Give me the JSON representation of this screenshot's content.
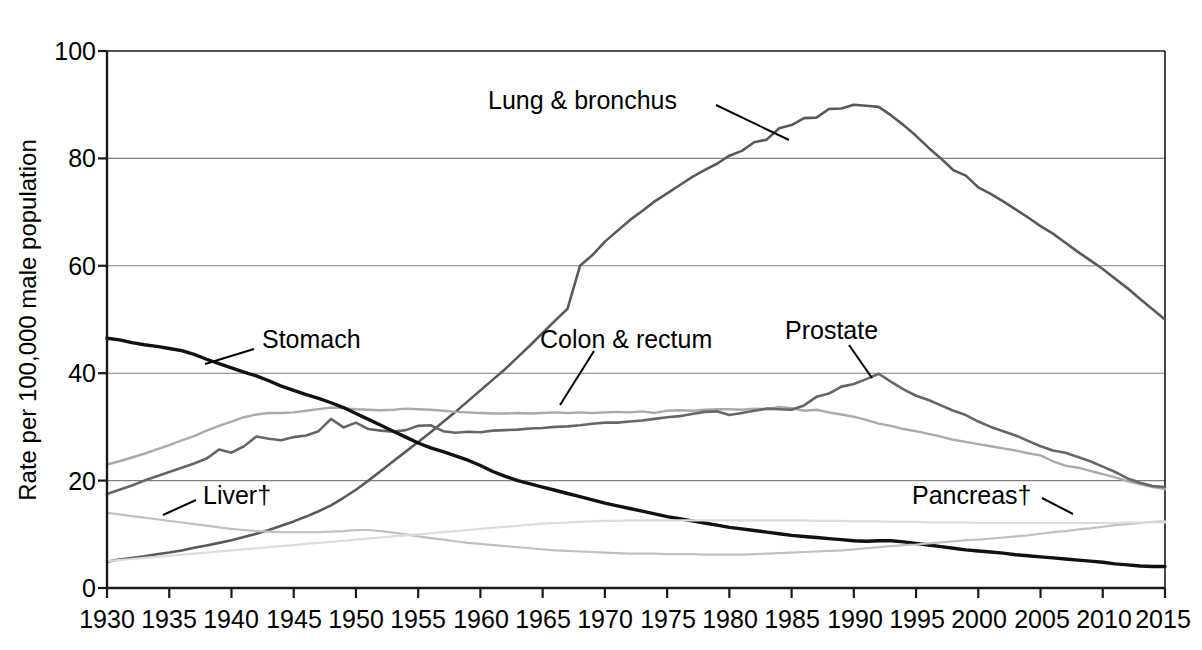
{
  "chart_data": {
    "type": "line",
    "title": "",
    "xlabel": "",
    "ylabel": "Rate per 100,000 male population",
    "xlim": [
      1930,
      2015
    ],
    "ylim": [
      0,
      100
    ],
    "yticks": [
      0,
      20,
      40,
      60,
      80,
      100
    ],
    "ytick_labels": [
      "0",
      "20",
      "40",
      "60",
      "80",
      "100"
    ],
    "xticks": [
      1930,
      1935,
      1940,
      1945,
      1950,
      1955,
      1960,
      1965,
      1970,
      1975,
      1980,
      1985,
      1990,
      1995,
      2000,
      2005,
      2010,
      2015
    ],
    "xtick_labels": [
      "1930",
      "1935",
      "1940",
      "1945",
      "1950",
      "1955",
      "1960",
      "1965",
      "1970",
      "1975",
      "1980",
      "1985",
      "1990",
      "1995",
      "2000",
      "2005",
      "2010",
      "2015"
    ],
    "grid": "horizontal",
    "legend": "inline-annotations",
    "x": [
      1930,
      1931,
      1932,
      1933,
      1934,
      1935,
      1936,
      1937,
      1938,
      1939,
      1940,
      1941,
      1942,
      1943,
      1944,
      1945,
      1946,
      1947,
      1948,
      1949,
      1950,
      1951,
      1952,
      1953,
      1954,
      1955,
      1956,
      1957,
      1958,
      1959,
      1960,
      1961,
      1962,
      1963,
      1964,
      1965,
      1966,
      1967,
      1968,
      1969,
      1970,
      1971,
      1972,
      1973,
      1974,
      1975,
      1976,
      1977,
      1978,
      1979,
      1980,
      1981,
      1982,
      1983,
      1984,
      1985,
      1986,
      1987,
      1988,
      1989,
      1990,
      1991,
      1992,
      1993,
      1994,
      1995,
      1996,
      1997,
      1998,
      1999,
      2000,
      2001,
      2002,
      2003,
      2004,
      2005,
      2006,
      2007,
      2008,
      2009,
      2010,
      2011,
      2012,
      2013,
      2014,
      2015
    ],
    "series": [
      {
        "name": "Lung & bronchus",
        "color": "#595959",
        "width": 2.6,
        "label_x": 1963,
        "label_y": 93,
        "values": [
          4.9,
          5.3,
          5.6,
          5.9,
          6.3,
          6.6,
          7.0,
          7.5,
          7.9,
          8.4,
          8.9,
          9.5,
          10.1,
          10.8,
          11.6,
          12.4,
          13.3,
          14.3,
          15.4,
          16.8,
          18.3,
          20.0,
          21.8,
          23.6,
          25.4,
          27.2,
          29.0,
          30.9,
          32.8,
          34.8,
          36.8,
          38.8,
          40.8,
          43.0,
          45.2,
          47.5,
          49.8,
          52.0,
          60.0,
          62.0,
          64.5,
          66.5,
          68.5,
          70.2,
          72.0,
          73.5,
          75.0,
          76.5,
          77.8,
          79.0,
          80.5,
          81.4,
          83.0,
          83.5,
          85.6,
          86.2,
          87.5,
          87.6,
          89.2,
          89.3,
          90.0,
          89.8,
          89.6,
          88.0,
          86.2,
          84.2,
          82.0,
          80.0,
          77.8,
          76.8,
          74.6,
          73.4,
          72.0,
          70.5,
          69.0,
          67.4,
          66.0,
          64.3,
          62.6,
          61.0,
          59.4,
          57.6,
          55.8,
          53.8,
          51.9,
          50.0
        ]
      },
      {
        "name": "Colon & rectum",
        "color": "#aaaaaa",
        "width": 2.4,
        "label_x": 1964,
        "label_y": 46,
        "values": [
          23.0,
          23.6,
          24.3,
          25.0,
          25.8,
          26.6,
          27.5,
          28.3,
          29.3,
          30.2,
          31.0,
          31.8,
          32.3,
          32.6,
          32.6,
          32.7,
          33.0,
          33.3,
          33.6,
          33.5,
          33.3,
          33.2,
          33.1,
          33.2,
          33.4,
          33.3,
          33.2,
          33.0,
          32.8,
          32.7,
          32.6,
          32.5,
          32.5,
          32.6,
          32.5,
          32.6,
          32.7,
          32.6,
          32.7,
          32.6,
          32.7,
          32.8,
          32.7,
          32.9,
          32.6,
          33.0,
          33.1,
          33.0,
          33.2,
          33.3,
          33.3,
          33.2,
          33.4,
          33.3,
          33.7,
          33.5,
          33.0,
          33.2,
          32.7,
          32.3,
          31.9,
          31.3,
          30.6,
          30.2,
          29.6,
          29.2,
          28.7,
          28.2,
          27.6,
          27.2,
          26.8,
          26.4,
          26.0,
          25.6,
          25.1,
          24.7,
          23.6,
          22.8,
          22.4,
          21.8,
          21.2,
          20.6,
          19.9,
          19.3,
          18.8,
          18.4
        ]
      },
      {
        "name": "Prostate",
        "color": "#666666",
        "width": 2.6,
        "label_x": 1984,
        "label_y": 46,
        "values": [
          17.5,
          18.3,
          19.1,
          20.0,
          20.8,
          21.6,
          22.4,
          23.2,
          24.1,
          25.8,
          25.2,
          26.4,
          28.2,
          27.8,
          27.5,
          28.1,
          28.4,
          29.2,
          31.5,
          29.9,
          30.8,
          29.6,
          29.3,
          29.1,
          29.4,
          30.2,
          30.3,
          29.2,
          28.9,
          29.1,
          29.0,
          29.3,
          29.4,
          29.5,
          29.7,
          29.8,
          30.0,
          30.1,
          30.3,
          30.6,
          30.8,
          30.8,
          31.0,
          31.2,
          31.5,
          31.8,
          32.0,
          32.4,
          32.8,
          32.9,
          32.2,
          32.6,
          33.0,
          33.4,
          33.3,
          33.2,
          34.0,
          35.6,
          36.2,
          37.5,
          38.0,
          38.9,
          39.9,
          38.4,
          37.0,
          35.8,
          35.0,
          34.0,
          33.0,
          32.2,
          31.0,
          30.0,
          29.2,
          28.4,
          27.4,
          26.4,
          25.6,
          25.2,
          24.4,
          23.6,
          22.6,
          21.6,
          20.4,
          19.6,
          19.0,
          18.8
        ]
      },
      {
        "name": "Stomach",
        "color": "#111111",
        "width": 3.4,
        "label_x": 1941,
        "label_y": 46,
        "values": [
          46.5,
          46.2,
          45.7,
          45.3,
          45.0,
          44.6,
          44.2,
          43.5,
          42.6,
          41.8,
          41.0,
          40.2,
          39.5,
          38.6,
          37.6,
          36.8,
          36.0,
          35.3,
          34.5,
          33.6,
          32.5,
          31.4,
          30.3,
          29.2,
          28.1,
          27.0,
          26.1,
          25.4,
          24.6,
          23.8,
          22.8,
          21.7,
          20.8,
          20.0,
          19.4,
          18.8,
          18.2,
          17.6,
          17.0,
          16.4,
          15.8,
          15.3,
          14.8,
          14.3,
          13.8,
          13.3,
          12.9,
          12.5,
          12.1,
          11.7,
          11.3,
          11.0,
          10.7,
          10.4,
          10.1,
          9.8,
          9.6,
          9.4,
          9.2,
          9.0,
          8.8,
          8.7,
          8.8,
          8.8,
          8.6,
          8.3,
          8.0,
          7.7,
          7.4,
          7.1,
          6.9,
          6.7,
          6.5,
          6.2,
          6.0,
          5.8,
          5.6,
          5.4,
          5.2,
          5.0,
          4.8,
          4.5,
          4.3,
          4.1,
          4.0,
          4.0
        ]
      },
      {
        "name": "Liver",
        "color": "#c0c0c0",
        "width": 2.2,
        "label_x": 1938,
        "label_y": 19.5,
        "values": [
          14.0,
          13.7,
          13.4,
          13.1,
          12.8,
          12.5,
          12.2,
          11.9,
          11.6,
          11.3,
          11.0,
          10.8,
          10.6,
          10.5,
          10.4,
          10.4,
          10.4,
          10.4,
          10.5,
          10.6,
          10.8,
          10.8,
          10.6,
          10.3,
          10.0,
          9.6,
          9.3,
          9.0,
          8.7,
          8.4,
          8.2,
          8.0,
          7.8,
          7.6,
          7.4,
          7.2,
          7.0,
          6.9,
          6.8,
          6.7,
          6.6,
          6.5,
          6.4,
          6.4,
          6.4,
          6.3,
          6.3,
          6.3,
          6.2,
          6.2,
          6.2,
          6.2,
          6.3,
          6.4,
          6.5,
          6.6,
          6.7,
          6.8,
          6.9,
          7.0,
          7.2,
          7.4,
          7.6,
          7.8,
          8.0,
          8.1,
          8.3,
          8.5,
          8.7,
          8.9,
          9.0,
          9.2,
          9.4,
          9.6,
          9.8,
          10.1,
          10.4,
          10.6,
          10.9,
          11.1,
          11.4,
          11.7,
          11.9,
          12.1,
          12.3,
          12.4
        ]
      },
      {
        "name": "Pancreas",
        "color": "#dcdcdc",
        "width": 2.2,
        "label_x": 1997,
        "label_y": 19.5,
        "values": [
          5.0,
          5.2,
          5.4,
          5.6,
          5.8,
          6.0,
          6.2,
          6.4,
          6.6,
          6.8,
          7.0,
          7.2,
          7.4,
          7.6,
          7.8,
          8.0,
          8.2,
          8.4,
          8.6,
          8.8,
          9.0,
          9.2,
          9.4,
          9.6,
          9.8,
          10.0,
          10.2,
          10.4,
          10.6,
          10.8,
          11.0,
          11.2,
          11.4,
          11.6,
          11.8,
          12.0,
          12.1,
          12.2,
          12.3,
          12.4,
          12.5,
          12.5,
          12.6,
          12.6,
          12.6,
          12.6,
          12.6,
          12.6,
          12.6,
          12.6,
          12.6,
          12.6,
          12.6,
          12.6,
          12.6,
          12.6,
          12.6,
          12.5,
          12.5,
          12.5,
          12.4,
          12.4,
          12.4,
          12.3,
          12.3,
          12.3,
          12.2,
          12.2,
          12.2,
          12.2,
          12.1,
          12.1,
          12.1,
          12.1,
          12.1,
          12.1,
          12.1,
          12.1,
          12.1,
          12.1,
          12.1,
          12.1,
          12.2,
          12.2,
          12.2,
          12.2
        ]
      }
    ],
    "annotations": [
      {
        "name": "lung-bronchus-label",
        "text": "Lung & bronchus"
      },
      {
        "name": "stomach-label",
        "text": "Stomach"
      },
      {
        "name": "colon-rectum-label",
        "text": "Colon & rectum"
      },
      {
        "name": "prostate-label",
        "text": "Prostate"
      },
      {
        "name": "liver-label",
        "text": "Liver†"
      },
      {
        "name": "pancreas-label",
        "text": "Pancreas†"
      }
    ]
  },
  "axis": {
    "y_title": "Rate per 100,000 male population",
    "y_labels": {
      "t0": "0",
      "t20": "20",
      "t40": "40",
      "t60": "60",
      "t80": "80",
      "t100": "100"
    },
    "x_labels": {
      "y1930": "1930",
      "y1935": "1935",
      "y1940": "1940",
      "y1945": "1945",
      "y1950": "1950",
      "y1955": "1955",
      "y1960": "1960",
      "y1965": "1965",
      "y1970": "1970",
      "y1975": "1975",
      "y1980": "1980",
      "y1985": "1985",
      "y1990": "1990",
      "y1995": "1995",
      "y2000": "2000",
      "y2005": "2005",
      "y2010": "2010",
      "y2015": "2015"
    }
  },
  "labels": {
    "lung": "Lung & bronchus",
    "stomach": "Stomach",
    "colon": "Colon & rectum",
    "prostate": "Prostate",
    "liver": "Liver†",
    "pancreas": "Pancreas†"
  }
}
